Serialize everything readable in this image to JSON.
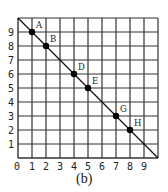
{
  "chart_data": {
    "type": "scatter",
    "title": "",
    "caption": "(b)",
    "xlabel": "",
    "ylabel": "",
    "xlim": [
      0,
      10
    ],
    "ylim": [
      0,
      10
    ],
    "grid": true,
    "x_ticks": [
      "0",
      "1",
      "2",
      "3",
      "4",
      "5",
      "6",
      "7",
      "8",
      "9"
    ],
    "y_ticks": [
      "1",
      "2",
      "3",
      "4",
      "5",
      "6",
      "7",
      "8",
      "9"
    ],
    "line": {
      "from": [
        0,
        10
      ],
      "to": [
        10,
        0
      ]
    },
    "points": [
      {
        "label": "A",
        "x": 1,
        "y": 9
      },
      {
        "label": "B",
        "x": 2,
        "y": 8
      },
      {
        "label": "D",
        "x": 4,
        "y": 6
      },
      {
        "label": "E",
        "x": 5,
        "y": 5
      },
      {
        "label": "G",
        "x": 7,
        "y": 3
      },
      {
        "label": "H",
        "x": 8,
        "y": 2
      }
    ]
  },
  "colors": {
    "grid": "#333333",
    "point": "#000000",
    "text": "#222222"
  }
}
